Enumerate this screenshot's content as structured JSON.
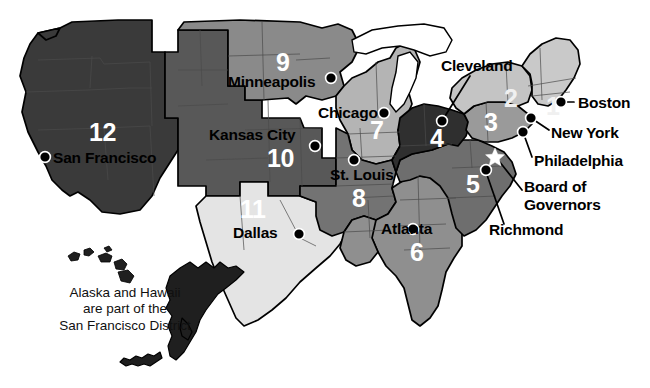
{
  "map": {
    "title": "Federal Reserve Districts of the United States",
    "note_lines": [
      "Alaska and Hawaii",
      "are part of the",
      "San Francisco District"
    ],
    "board_star_name": "board-of-governors-star",
    "colors": {
      "district_1": "#c9c9c9",
      "district_2": "#c4c4c4",
      "district_3": "#9a9a9a",
      "district_4": "#2f2f2f",
      "district_5": "#6e6e6e",
      "district_6": "#8f8f8f",
      "district_7": "#b4b4b4",
      "district_8": "#737373",
      "district_9": "#8a8a8a",
      "district_10": "#585858",
      "district_11": "#e4e4e4",
      "district_12": "#3a3a3a",
      "alaska": "#1f1f1f",
      "hawaii": "#1f1f1f",
      "outline": "#000000",
      "background": "#ffffff",
      "label_text": "#000000",
      "number_text": "#ffffff"
    },
    "districts": [
      {
        "id": "1",
        "number": "1",
        "city": "Boston",
        "num_x": 544,
        "num_y": 96,
        "fill_key": "district_1"
      },
      {
        "id": "2",
        "number": "2",
        "city": "New York",
        "num_x": 503,
        "num_y": 88,
        "fill_key": "district_2"
      },
      {
        "id": "3",
        "number": "3",
        "city": "Philadelphia",
        "num_x": 483,
        "num_y": 112,
        "fill_key": "district_3"
      },
      {
        "id": "4",
        "number": "4",
        "city": "Cleveland",
        "num_x": 430,
        "num_y": 127,
        "fill_key": "district_4"
      },
      {
        "id": "5",
        "number": "5",
        "city": "Richmond",
        "num_x": 466,
        "num_y": 175,
        "fill_key": "district_5"
      },
      {
        "id": "6",
        "number": "6",
        "city": "Atlanta",
        "num_x": 412,
        "num_y": 243,
        "fill_key": "district_6"
      },
      {
        "id": "7",
        "number": "7",
        "city": "Chicago",
        "num_x": 370,
        "num_y": 125,
        "fill_key": "district_7"
      },
      {
        "id": "8",
        "number": "8",
        "city": "St. Louis",
        "num_x": 355,
        "num_y": 190,
        "fill_key": "district_8"
      },
      {
        "id": "9",
        "number": "9",
        "city": "Minneapolis",
        "num_x": 276,
        "num_y": 55,
        "fill_key": "district_9"
      },
      {
        "id": "10",
        "number": "10",
        "city": "Kansas City",
        "num_x": 272,
        "num_y": 152,
        "fill_key": "district_10"
      },
      {
        "id": "11",
        "number": "11",
        "city": "Dallas",
        "num_x": 245,
        "num_y": 203,
        "fill_key": "district_11"
      },
      {
        "id": "12",
        "number": "12",
        "city": "San Francisco",
        "num_x": 89,
        "num_y": 125,
        "fill_key": "district_12"
      }
    ],
    "city_labels": [
      {
        "name": "minneapolis",
        "text": "Minneapolis",
        "x": 228,
        "y": 74,
        "anchor": "left"
      },
      {
        "name": "chicago",
        "text": "Chicago",
        "x": 318,
        "y": 105,
        "anchor": "left"
      },
      {
        "name": "kansas-city",
        "text": "Kansas City",
        "x": 209,
        "y": 127,
        "anchor": "left"
      },
      {
        "name": "san-francisco",
        "text": "San Francisco",
        "x": 53,
        "y": 159,
        "anchor": "left"
      },
      {
        "name": "st-louis",
        "text": "St. Louis",
        "x": 328,
        "y": 170,
        "anchor": "left"
      },
      {
        "name": "dallas",
        "text": "Dallas",
        "x": 233,
        "y": 225,
        "anchor": "left"
      },
      {
        "name": "atlanta",
        "text": "Atlanta",
        "x": 381,
        "y": 224,
        "anchor": "left"
      },
      {
        "name": "cleveland",
        "text": "Cleveland",
        "x": 441,
        "y": 60,
        "anchor": "left"
      },
      {
        "name": "boston",
        "text": "Boston",
        "x": 577,
        "y": 106,
        "anchor": "left"
      },
      {
        "name": "new-york",
        "text": "New York",
        "x": 551,
        "y": 134,
        "anchor": "left"
      },
      {
        "name": "philadelphia",
        "text": "Philadelphia",
        "x": 534,
        "y": 161,
        "anchor": "left"
      },
      {
        "name": "richmond",
        "text": "Richmond",
        "x": 489,
        "y": 229,
        "anchor": "left"
      }
    ],
    "board_label": {
      "name": "board-of-governors",
      "line1": "Board of",
      "line2": "Governors",
      "x": 524,
      "y": 186
    },
    "city_dots": [
      {
        "name": "minneapolis-dot",
        "x": 331,
        "y": 78
      },
      {
        "name": "chicago-dot",
        "x": 384,
        "y": 113
      },
      {
        "name": "kansas-city-dot",
        "x": 315,
        "y": 146
      },
      {
        "name": "san-francisco-dot",
        "x": 45,
        "y": 157
      },
      {
        "name": "st-louis-dot",
        "x": 354,
        "y": 160
      },
      {
        "name": "dallas-dot",
        "x": 299,
        "y": 234
      },
      {
        "name": "atlanta-dot",
        "x": 413,
        "y": 229
      },
      {
        "name": "cleveland-dot",
        "x": 442,
        "y": 121
      },
      {
        "name": "boston-dot",
        "x": 561,
        "y": 102
      },
      {
        "name": "new-york-dot",
        "x": 531,
        "y": 118
      },
      {
        "name": "philadelphia-dot",
        "x": 523,
        "y": 132
      },
      {
        "name": "richmond-dot",
        "x": 486,
        "y": 170
      }
    ]
  }
}
